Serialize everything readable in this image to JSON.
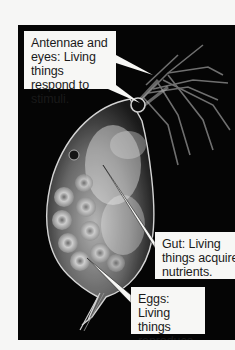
{
  "figure": {
    "background_color": "#050505",
    "page_color": "#f6f6f5",
    "labels": [
      {
        "id": "antennae",
        "text_lines": [
          "Antennae and",
          "eyes: Living",
          "things respond",
          "to stimuli."
        ],
        "text": "Antennae and eyes: Living things respond to stimuli."
      },
      {
        "id": "gut",
        "text_lines": [
          "Gut: Living",
          "things acquire",
          "nutrients."
        ],
        "text": "Gut: Living things acquire nutrients."
      },
      {
        "id": "eggs",
        "text_lines": [
          "Eggs: Living",
          "things",
          "reproduce."
        ],
        "text": "Eggs: Living things reproduce."
      }
    ]
  }
}
